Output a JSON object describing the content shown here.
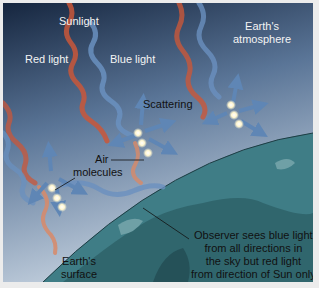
{
  "diagram": {
    "labels": {
      "sunlight": "Sunlight",
      "red_light": "Red light",
      "blue_light": "Blue light",
      "atmosphere_line1": "Earth's",
      "atmosphere_line2": "atmosphere",
      "scattering": "Scattering",
      "air_line1": "Air",
      "air_line2": "molecules",
      "surface_line1": "Earth's",
      "surface_line2": "surface",
      "observer_line1": "Observer sees blue light",
      "observer_line2": "from all directions in",
      "observer_line3": "the sky but red light",
      "observer_line4": "from direction of Sun only"
    },
    "colors": {
      "sky_top": "#16263f",
      "sky_bottom": "#b9c8d9",
      "red_beam": "#c9573a",
      "blue_beam": "#5f86b5",
      "earth_ocean": "#3f7d86",
      "earth_land": "#2d5e66",
      "molecule": "#fffbe6"
    }
  }
}
